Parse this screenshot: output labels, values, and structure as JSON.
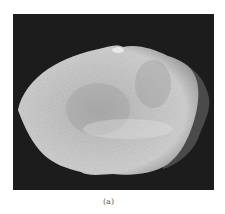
{
  "figure": {
    "caption": "(a)",
    "background_color": "#1c1c1c",
    "rock_color": "#c8c8c8"
  }
}
